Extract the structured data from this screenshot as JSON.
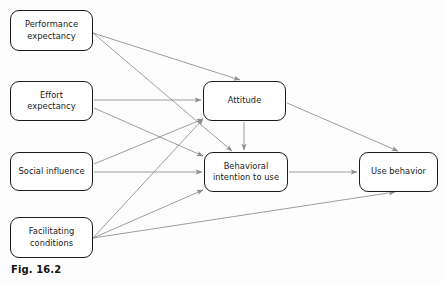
{
  "figure": {
    "caption": "Fig. 16.2",
    "background_color": "#fdfdfd",
    "node_border_color": "#1c1c1c",
    "edge_color": "#8d8d8d",
    "text_color": "#1a1a1a"
  },
  "nodes": [
    {
      "id": "performance-expectancy",
      "label": "Performance\nexpectancy",
      "x": 10,
      "y": 10,
      "w": 83,
      "h": 41
    },
    {
      "id": "effort-expectancy",
      "label": "Effort\nexpectancy",
      "x": 10,
      "y": 81,
      "w": 83,
      "h": 40
    },
    {
      "id": "social-influence",
      "label": "Social influence",
      "x": 10,
      "y": 152,
      "w": 83,
      "h": 39
    },
    {
      "id": "facilitating-conditions",
      "label": "Facilitating\nconditions",
      "x": 10,
      "y": 217,
      "w": 83,
      "h": 41
    },
    {
      "id": "attitude",
      "label": "Attitude",
      "x": 203,
      "y": 81,
      "w": 83,
      "h": 40
    },
    {
      "id": "behavioral-intention",
      "label": "Behavioral\nintention to use",
      "x": 204,
      "y": 152,
      "w": 84,
      "h": 40
    },
    {
      "id": "use-behavior",
      "label": "Use behavior",
      "x": 359,
      "y": 152,
      "w": 79,
      "h": 40
    }
  ],
  "edges": [
    {
      "id": "pe-to-attitude",
      "from": "performance-expectancy",
      "to": "attitude",
      "x1": 93,
      "y1": 33,
      "x2": 240,
      "y2": 80
    },
    {
      "id": "pe-to-bi",
      "from": "performance-expectancy",
      "to": "behavioral-intention",
      "x1": 93,
      "y1": 33,
      "x2": 232,
      "y2": 151
    },
    {
      "id": "ee-to-attitude",
      "from": "effort-expectancy",
      "to": "attitude",
      "x1": 94,
      "y1": 100,
      "x2": 201,
      "y2": 100
    },
    {
      "id": "ee-to-bi",
      "from": "effort-expectancy",
      "to": "behavioral-intention",
      "x1": 94,
      "y1": 108,
      "x2": 203,
      "y2": 156
    },
    {
      "id": "si-to-attitude",
      "from": "social-influence",
      "to": "attitude",
      "x1": 94,
      "y1": 164,
      "x2": 203,
      "y2": 119
    },
    {
      "id": "si-to-bi",
      "from": "social-influence",
      "to": "behavioral-intention",
      "x1": 94,
      "y1": 172,
      "x2": 202,
      "y2": 172
    },
    {
      "id": "fc-to-attitude",
      "from": "facilitating-conditions",
      "to": "attitude",
      "x1": 93,
      "y1": 238,
      "x2": 203,
      "y2": 119
    },
    {
      "id": "fc-to-bi",
      "from": "facilitating-conditions",
      "to": "behavioral-intention",
      "x1": 93,
      "y1": 238,
      "x2": 203,
      "y2": 190
    },
    {
      "id": "fc-to-use",
      "from": "facilitating-conditions",
      "to": "use-behavior",
      "x1": 93,
      "y1": 238,
      "x2": 395,
      "y2": 192
    },
    {
      "id": "attitude-to-bi",
      "from": "attitude",
      "to": "behavioral-intention",
      "x1": 244,
      "y1": 122,
      "x2": 244,
      "y2": 150
    },
    {
      "id": "attitude-to-use",
      "from": "attitude",
      "to": "use-behavior",
      "x1": 287,
      "y1": 103,
      "x2": 398,
      "y2": 151
    },
    {
      "id": "bi-to-use",
      "from": "behavioral-intention",
      "to": "use-behavior",
      "x1": 289,
      "y1": 172,
      "x2": 357,
      "y2": 172
    }
  ]
}
